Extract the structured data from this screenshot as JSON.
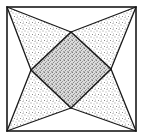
{
  "diagram": {
    "type": "geometric-figure",
    "canvas": {
      "width": 143,
      "height": 139
    },
    "colors": {
      "background": "#ffffff",
      "stroke": "#1a1a1a",
      "stipple_light": "#9a9a9a",
      "stipple_dark": "#7a7a7a",
      "center_fill": "#d6d6d6"
    },
    "outer_square": {
      "corners": {
        "top_left": [
          7,
          7
        ],
        "top_right": [
          136,
          7
        ],
        "bottom_right": [
          136,
          131
        ],
        "bottom_left": [
          7,
          131
        ]
      }
    },
    "inner_diamond": {
      "vertices": {
        "top": [
          71,
          32
        ],
        "right": [
          111,
          69
        ],
        "bottom": [
          71,
          108
        ],
        "left": [
          31,
          70
        ]
      },
      "shading": "dense-stipple"
    },
    "star_arms": [
      {
        "name": "top-left-arm",
        "corner": "top_left",
        "vertices": [
          "top",
          "left"
        ],
        "shading": "light-stipple"
      },
      {
        "name": "top-right-arm",
        "corner": "top_right",
        "vertices": [
          "top",
          "right"
        ],
        "shading": "light-stipple"
      },
      {
        "name": "bottom-right-arm",
        "corner": "bottom_right",
        "vertices": [
          "right",
          "bottom"
        ],
        "shading": "light-stipple"
      },
      {
        "name": "bottom-left-arm",
        "corner": "bottom_left",
        "vertices": [
          "bottom",
          "left"
        ],
        "shading": "light-stipple"
      }
    ],
    "side_triangles": [
      {
        "name": "top-side-triangle",
        "shading": "none"
      },
      {
        "name": "right-side-triangle",
        "shading": "none"
      },
      {
        "name": "bottom-side-triangle",
        "shading": "none"
      },
      {
        "name": "left-side-triangle",
        "shading": "none"
      }
    ]
  }
}
